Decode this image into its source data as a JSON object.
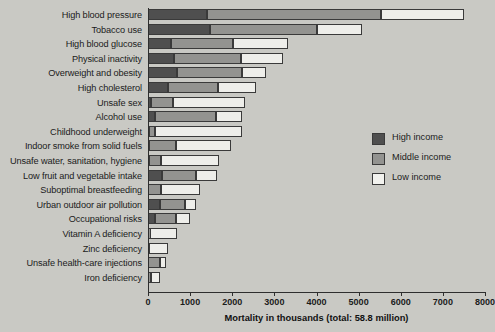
{
  "chart_data": {
    "type": "bar",
    "orientation": "horizontal",
    "stacked": true,
    "title": "",
    "xlabel": "Mortality in thousands (total: 58.8 million)",
    "ylabel": "",
    "xlim": [
      0,
      8000
    ],
    "xticks": [
      0,
      1000,
      2000,
      3000,
      4000,
      5000,
      6000,
      7000,
      8000
    ],
    "xtick_labels": [
      "0",
      "1000",
      "2000",
      "3000",
      "4000",
      "5000",
      "6000",
      "7000",
      "8000"
    ],
    "grid": false,
    "legend_position": "right",
    "categories": [
      "High blood pressure",
      "Tobacco use",
      "High blood glucose",
      "Physical inactivity",
      "Overweight and obesity",
      "High cholesterol",
      "Unsafe sex",
      "Alcohol use",
      "Childhood underweight",
      "Indoor smoke from solid fuels",
      "Unsafe water, sanitation, hygiene",
      "Low fruit and vegetable intake",
      "Suboptimal breastfeeding",
      "Urban outdoor air pollution",
      "Occupational risks",
      "Vitamin A deficiency",
      "Zinc deficiency",
      "Unsafe health-care injections",
      "Iron deficiency"
    ],
    "series": [
      {
        "name": "High income",
        "color": "#4f4f4f",
        "values": [
          1390,
          1460,
          540,
          620,
          700,
          470,
          60,
          160,
          30,
          20,
          20,
          340,
          10,
          290,
          160,
          10,
          10,
          10,
          10
        ]
      },
      {
        "name": "Middle income",
        "color": "#939390",
        "values": [
          4130,
          2560,
          1480,
          1580,
          1520,
          1200,
          540,
          1460,
          140,
          650,
          290,
          800,
          290,
          600,
          510,
          30,
          20,
          280,
          70
        ]
      },
      {
        "name": "Low income",
        "color": "#eeeeea",
        "values": [
          1980,
          1070,
          1300,
          1000,
          590,
          900,
          1710,
          610,
          2060,
          1290,
          1380,
          510,
          930,
          240,
          330,
          640,
          440,
          140,
          210
        ]
      }
    ],
    "totals": [
      7500,
      5090,
      3320,
      3200,
      2810,
      2570,
      2310,
      2230,
      2230,
      1960,
      1690,
      1650,
      1230,
      1130,
      1000,
      680,
      470,
      430,
      290
    ]
  },
  "legend": {
    "items": [
      {
        "label": "High income",
        "swatch": "high"
      },
      {
        "label": "Middle income",
        "swatch": "middle"
      },
      {
        "label": "Low income",
        "swatch": "low"
      }
    ]
  },
  "colors": {
    "high_income": "#4f4f4f",
    "middle_income": "#939390",
    "low_income": "#eeeeea",
    "background": "#c9c9c4",
    "axis": "#2e2e2e"
  }
}
